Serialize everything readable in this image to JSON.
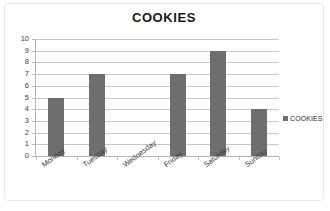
{
  "chart_data": {
    "type": "bar",
    "title": "COOKIES",
    "xlabel": "",
    "ylabel": "",
    "categories": [
      "Monday",
      "Tuesday",
      "Wednesday",
      "Friday",
      "Saturday",
      "Sunday"
    ],
    "values": [
      5,
      7,
      0,
      7,
      9,
      4
    ],
    "series": [
      {
        "name": "COOKIES",
        "values": [
          5,
          7,
          0,
          7,
          9,
          4
        ]
      }
    ],
    "ylim": [
      0,
      10
    ],
    "ytick_labels": [
      "10",
      "9",
      "8",
      "7",
      "6",
      "5",
      "4",
      "3",
      "2",
      "1",
      "0"
    ],
    "ytick_values": [
      10,
      9,
      8,
      7,
      6,
      5,
      4,
      3,
      2,
      1,
      0
    ],
    "grid": true,
    "grid_axis": "y",
    "legend": {
      "position": "right",
      "entries": [
        "COOKIES"
      ]
    },
    "colors": {
      "bar": "#6e6e6e",
      "gridline": "#c9c9c9",
      "axis": "#b4b4b4",
      "title_text": "#1a1a1a",
      "tick_text": "#3c3c3c",
      "background": "#ffffff",
      "frame_border": "#e8e8e8"
    }
  }
}
